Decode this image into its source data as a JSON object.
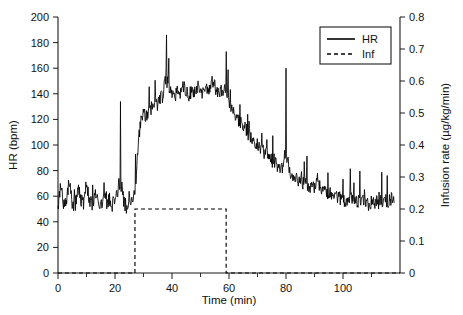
{
  "chart_data": {
    "type": "line",
    "title": "",
    "xlabel": "Time (min)",
    "ylabel": "HR (bpm)",
    "y2label": "Infusion rate (µg/kg/min)",
    "xlim": [
      0,
      120
    ],
    "ylim": [
      0,
      200
    ],
    "y2lim": [
      0,
      0.8
    ],
    "grid": false,
    "legend_position": "top-right",
    "x_ticks": [
      0,
      20,
      40,
      60,
      80,
      100
    ],
    "x_ticks_minor": [
      10,
      30,
      50,
      70,
      90,
      110
    ],
    "y_ticks": [
      0,
      20,
      40,
      60,
      80,
      100,
      120,
      140,
      160,
      180,
      200
    ],
    "y2_ticks": [
      "0",
      "0.1",
      "0.2",
      "0.3",
      "0.4",
      "0.5",
      "0.6",
      "0.7",
      "0.8"
    ],
    "legend": [
      {
        "label": "HR",
        "style": "solid"
      },
      {
        "label": "Inf",
        "style": "dashed"
      }
    ],
    "series": [
      {
        "name": "HR",
        "axis": "left",
        "style": "solid",
        "units": "bpm",
        "description": "Heart rate recording; baseline ~50-65 bpm with beat-to-beat spikes, abrupt rise at ~27 min to a plateau of ~135-145 bpm between 40 and 58 min, then gradual decline back to ~55-65 bpm by 110-118 min. Isolated artefact spikes reach 185 bpm near 38 min and 160 bpm near 80 min.",
        "x": [
          0,
          1,
          2,
          3,
          4,
          5,
          6,
          7,
          8,
          9,
          10,
          11,
          12,
          13,
          14,
          15,
          16,
          17,
          18,
          19,
          20,
          21,
          22,
          23,
          24,
          25,
          26,
          27,
          28,
          29,
          30,
          31,
          32,
          33,
          34,
          35,
          36,
          37,
          38,
          39,
          40,
          41,
          42,
          43,
          44,
          45,
          46,
          47,
          48,
          49,
          50,
          51,
          52,
          53,
          54,
          55,
          56,
          57,
          58,
          59,
          60,
          61,
          62,
          63,
          64,
          65,
          66,
          67,
          68,
          69,
          70,
          71,
          72,
          73,
          74,
          75,
          76,
          77,
          78,
          79,
          80,
          81,
          82,
          83,
          84,
          85,
          86,
          87,
          88,
          89,
          90,
          91,
          92,
          93,
          94,
          95,
          96,
          97,
          98,
          99,
          100,
          101,
          102,
          103,
          104,
          105,
          106,
          107,
          108,
          109,
          110,
          111,
          112,
          113,
          114,
          115,
          116,
          117,
          118
        ],
        "y": [
          52,
          70,
          54,
          58,
          72,
          55,
          53,
          68,
          57,
          54,
          70,
          58,
          52,
          63,
          56,
          51,
          60,
          55,
          58,
          53,
          57,
          62,
          134,
          56,
          52,
          59,
          54,
          63,
          96,
          118,
          126,
          122,
          130,
          128,
          134,
          132,
          138,
          136,
          186,
          140,
          141,
          137,
          143,
          140,
          145,
          142,
          138,
          144,
          141,
          147,
          143,
          140,
          146,
          142,
          150,
          145,
          139,
          143,
          141,
          173,
          132,
          128,
          124,
          120,
          118,
          115,
          112,
          108,
          106,
          103,
          100,
          98,
          95,
          93,
          90,
          88,
          86,
          84,
          82,
          80,
          160,
          78,
          76,
          75,
          73,
          72,
          70,
          69,
          68,
          67,
          66,
          78,
          65,
          64,
          63,
          62,
          61,
          60,
          59,
          58,
          57,
          56,
          58,
          57,
          56,
          55,
          57,
          56,
          55,
          54,
          56,
          55,
          54,
          56,
          55,
          57,
          56,
          58,
          57
        ]
      },
      {
        "name": "Inf",
        "axis": "right",
        "style": "dashed",
        "units": "µg/kg/min",
        "description": "Step infusion: zero before 27 min, constant 0.2 µg/kg/min from 27 to 59 min, zero thereafter.",
        "x": [
          0,
          27,
          27,
          59,
          59,
          120
        ],
        "y": [
          0,
          0,
          0.2,
          0.2,
          0,
          0
        ]
      }
    ]
  }
}
